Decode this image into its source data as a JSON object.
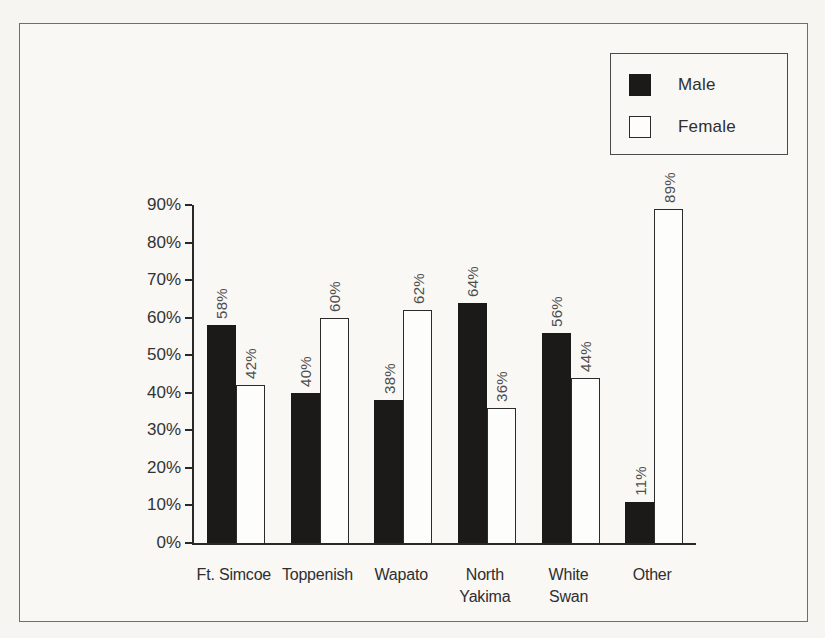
{
  "legend": {
    "items": [
      {
        "label": "Male",
        "swatch_color": "#1b1a19"
      },
      {
        "label": "Female",
        "swatch_color": "#fdfdfb"
      }
    ],
    "position": "top-right"
  },
  "colors": {
    "male_bar": "#1b1a19",
    "female_bar": "#fdfdfb",
    "axis": "#282828",
    "frame_border": "#6f6f6f",
    "background": "#f6f5f1"
  },
  "chart_data": {
    "type": "bar",
    "title": "",
    "xlabel": "",
    "ylabel": "",
    "categories": [
      "Ft. Simcoe",
      "Toppenish",
      "Wapato",
      "North\nYakima",
      "White\nSwan",
      "Other"
    ],
    "series": [
      {
        "name": "Male",
        "color": "#1b1a19",
        "values": [
          58,
          40,
          38,
          64,
          56,
          11
        ]
      },
      {
        "name": "Female",
        "color": "#fdfdfb",
        "values": [
          42,
          60,
          62,
          36,
          44,
          89
        ]
      }
    ],
    "value_labels": {
      "Male": [
        "58%",
        "40%",
        "38%",
        "64%",
        "56%",
        "11%"
      ],
      "Female": [
        "42%",
        "60%",
        "62%",
        "36%",
        "44%",
        "89%"
      ]
    },
    "value_label_rotation": "90-degrees-bottom-to-top",
    "y_axis": {
      "min": 0,
      "max": 90,
      "step": 10,
      "tick_labels": [
        "0%",
        "10%",
        "20%",
        "30%",
        "40%",
        "50%",
        "60%",
        "70%",
        "80%",
        "90%"
      ]
    },
    "grid": false,
    "legend_position": "top-right"
  }
}
